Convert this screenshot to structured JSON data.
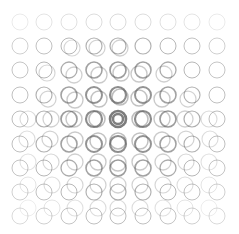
{
  "grid": {
    "cols": 9,
    "rows": 9,
    "x_centers": [
      20,
      44,
      69,
      94,
      118,
      143,
      168,
      192,
      217
    ],
    "y_centers": [
      22,
      46,
      70,
      95,
      119,
      144,
      168,
      192,
      216
    ],
    "radius": 8,
    "center_cell": [
      4,
      4
    ],
    "base_color": "#555555",
    "ghost_color": "#777777"
  },
  "ghost_offsets": [
    [
      [
        0,
        0
      ],
      [
        0,
        0
      ],
      [
        0,
        0
      ],
      [
        0,
        0
      ],
      [
        0,
        0
      ],
      [
        0,
        0
      ],
      [
        0,
        0
      ],
      [
        0,
        0
      ],
      [
        0,
        0
      ]
    ],
    [
      [
        0,
        0
      ],
      [
        0,
        0
      ],
      [
        3,
        2
      ],
      [
        3,
        2
      ],
      [
        2,
        2
      ],
      [
        0,
        0
      ],
      [
        0,
        0
      ],
      [
        0,
        0
      ],
      [
        0,
        0
      ]
    ],
    [
      [
        0,
        0
      ],
      [
        3,
        3
      ],
      [
        5,
        5
      ],
      [
        5,
        5
      ],
      [
        3,
        3
      ],
      [
        -4,
        4
      ],
      [
        -4,
        4
      ],
      [
        0,
        0
      ],
      [
        0,
        0
      ]
    ],
    [
      [
        0,
        0
      ],
      [
        4,
        4
      ],
      [
        6,
        5
      ],
      [
        5,
        4
      ],
      [
        2,
        2
      ],
      [
        -4,
        3
      ],
      [
        -6,
        4
      ],
      [
        -4,
        4
      ],
      [
        0,
        0
      ]
    ],
    [
      [
        8,
        0
      ],
      [
        7,
        0
      ],
      [
        5,
        0
      ],
      [
        3,
        0
      ],
      [
        0,
        0
      ],
      [
        -3,
        0
      ],
      [
        -6,
        0
      ],
      [
        -7,
        0
      ],
      [
        -8,
        0
      ]
    ],
    [
      [
        7,
        -5
      ],
      [
        6,
        -5
      ],
      [
        6,
        -4
      ],
      [
        4,
        -3
      ],
      [
        0,
        -3
      ],
      [
        -3,
        -3
      ],
      [
        -6,
        -4
      ],
      [
        -6,
        -5
      ],
      [
        -7,
        -5
      ]
    ],
    [
      [
        8,
        -6
      ],
      [
        7,
        -6
      ],
      [
        6,
        -6
      ],
      [
        4,
        -6
      ],
      [
        0,
        -5
      ],
      [
        -3,
        -6
      ],
      [
        -5,
        -6
      ],
      [
        -6,
        -6
      ],
      [
        -8,
        -6
      ]
    ],
    [
      [
        8,
        -7
      ],
      [
        8,
        -7
      ],
      [
        6,
        -7
      ],
      [
        4,
        -7
      ],
      [
        0,
        -7
      ],
      [
        -3,
        -7
      ],
      [
        -5,
        -7
      ],
      [
        -7,
        -7
      ],
      [
        -8,
        -7
      ]
    ],
    [
      [
        8,
        -8
      ],
      [
        8,
        -8
      ],
      [
        6,
        -8
      ],
      [
        4,
        -8
      ],
      [
        0,
        -8
      ],
      [
        -3,
        -8
      ],
      [
        -5,
        -8
      ],
      [
        -7,
        -8
      ],
      [
        -8,
        -8
      ]
    ]
  ]
}
